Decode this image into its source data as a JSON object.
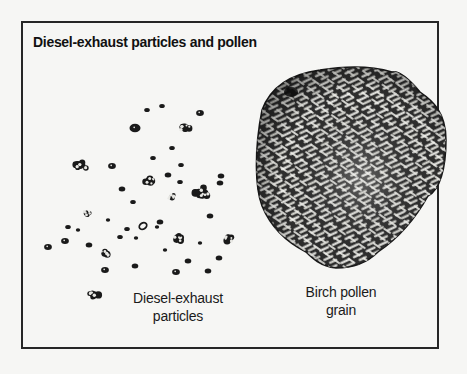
{
  "figure": {
    "title": "Diesel-exhaust particles and pollen",
    "labels": {
      "diesel": {
        "line1": "Diesel-exhaust",
        "line2": "particles"
      },
      "pollen": {
        "line1": "Birch pollen",
        "line2": "grain"
      }
    },
    "colors": {
      "background": "#f6f6f4",
      "border": "#262626",
      "ink": "#1a1a1a",
      "pollen_fill": "#3a3a3a",
      "pollen_highlight": "#e8e8e4"
    },
    "diesel_particles": [
      {
        "x": 147,
        "y": 110,
        "r": 2.5
      },
      {
        "x": 162,
        "y": 106,
        "r": 2.5
      },
      {
        "x": 200,
        "y": 113,
        "r": 3.5
      },
      {
        "x": 135,
        "y": 128,
        "r": 5
      },
      {
        "x": 185,
        "y": 127,
        "r": 8,
        "cluster": true
      },
      {
        "x": 172,
        "y": 148,
        "r": 2.5
      },
      {
        "x": 80,
        "y": 165,
        "r": 8,
        "cluster": true,
        "elongated": true
      },
      {
        "x": 112,
        "y": 166,
        "r": 3.5
      },
      {
        "x": 153,
        "y": 158,
        "r": 2.5
      },
      {
        "x": 150,
        "y": 181,
        "r": 8,
        "cluster": true
      },
      {
        "x": 168,
        "y": 175,
        "r": 3
      },
      {
        "x": 181,
        "y": 165,
        "r": 2.5
      },
      {
        "x": 180,
        "y": 182,
        "r": 2.5
      },
      {
        "x": 122,
        "y": 189,
        "r": 3
      },
      {
        "x": 133,
        "y": 202,
        "r": 2.5
      },
      {
        "x": 172,
        "y": 197,
        "r": 6,
        "cluster": true
      },
      {
        "x": 202,
        "y": 193,
        "r": 8,
        "cluster": true,
        "elongated": true
      },
      {
        "x": 221,
        "y": 176,
        "r": 3
      },
      {
        "x": 220,
        "y": 183,
        "r": 3
      },
      {
        "x": 87,
        "y": 213,
        "r": 6,
        "cluster": true
      },
      {
        "x": 210,
        "y": 216,
        "r": 3
      },
      {
        "x": 108,
        "y": 220,
        "r": 2
      },
      {
        "x": 68,
        "y": 227,
        "r": 2.5
      },
      {
        "x": 78,
        "y": 230,
        "r": 2
      },
      {
        "x": 48,
        "y": 247,
        "r": 3.5
      },
      {
        "x": 65,
        "y": 241,
        "r": 3.5
      },
      {
        "x": 89,
        "y": 245,
        "r": 3
      },
      {
        "x": 105,
        "y": 253,
        "r": 7,
        "cluster": true
      },
      {
        "x": 120,
        "y": 237,
        "r": 2.5
      },
      {
        "x": 127,
        "y": 229,
        "r": 2.5
      },
      {
        "x": 143,
        "y": 226,
        "r": 4,
        "hollow": true
      },
      {
        "x": 136,
        "y": 238,
        "r": 2
      },
      {
        "x": 160,
        "y": 222,
        "r": 3
      },
      {
        "x": 157,
        "y": 227,
        "r": 2
      },
      {
        "x": 178,
        "y": 238,
        "r": 8,
        "cluster": true
      },
      {
        "x": 165,
        "y": 250,
        "r": 2
      },
      {
        "x": 200,
        "y": 243,
        "r": 2
      },
      {
        "x": 230,
        "y": 238,
        "r": 8,
        "cluster": true
      },
      {
        "x": 188,
        "y": 261,
        "r": 3
      },
      {
        "x": 219,
        "y": 258,
        "r": 3
      },
      {
        "x": 105,
        "y": 270,
        "r": 3.5
      },
      {
        "x": 135,
        "y": 266,
        "r": 3
      },
      {
        "x": 176,
        "y": 272,
        "r": 3.5
      },
      {
        "x": 208,
        "y": 271,
        "r": 3
      },
      {
        "x": 94,
        "y": 295,
        "r": 8,
        "cluster": true
      }
    ],
    "pollen_grain": {
      "center": [
        345,
        165
      ],
      "pore": [
        291,
        92
      ]
    }
  }
}
